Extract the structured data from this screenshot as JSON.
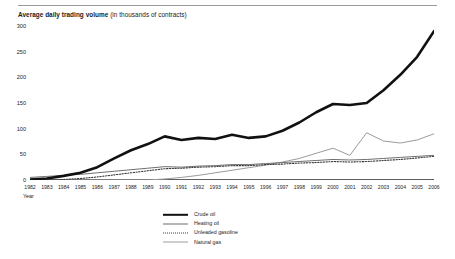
{
  "header": {
    "title_main": "Average daily trading volume",
    "title_sub": " (in thousands of contracts)"
  },
  "axes": {
    "x_label": "Year",
    "y_ticks": [
      "0",
      "50",
      "100",
      "150",
      "200",
      "250",
      "300"
    ],
    "x_ticks": [
      "1982",
      "1983",
      "1984",
      "1985",
      "1986",
      "1987",
      "1988",
      "1989",
      "1990",
      "1991",
      "1992",
      "1993",
      "1994",
      "1995",
      "1996",
      "1997",
      "1998",
      "1999",
      "2000",
      "2001",
      "2002",
      "2003",
      "2004",
      "2005",
      "2006"
    ]
  },
  "legend": {
    "items": [
      {
        "label": "Crude oil",
        "style": "thick-solid",
        "color": "#111111"
      },
      {
        "label": "Heating oil",
        "style": "thin-solid",
        "color": "#6f6f6f"
      },
      {
        "label": "Unleaded gasoline",
        "style": "dotted",
        "color": "#3a3a3a"
      },
      {
        "label": "Natural gas",
        "style": "thin-solid",
        "color": "#9b9b9b"
      }
    ]
  },
  "chart_data": {
    "type": "line",
    "title": "Average daily trading volume (in thousands of contracts)",
    "xlabel": "Year",
    "ylabel": "",
    "ylim": [
      0,
      300
    ],
    "xlim": [
      1982,
      2006
    ],
    "grid": false,
    "legend_position": "bottom-center",
    "x": [
      1982,
      1983,
      1984,
      1985,
      1986,
      1987,
      1988,
      1989,
      1990,
      1991,
      1992,
      1993,
      1994,
      1995,
      1996,
      1997,
      1998,
      1999,
      2000,
      2001,
      2002,
      2003,
      2004,
      2005,
      2006
    ],
    "series": [
      {
        "name": "Crude oil",
        "color": "#111111",
        "style": "thick-solid",
        "values": [
          1,
          3,
          8,
          14,
          25,
          42,
          58,
          70,
          85,
          78,
          82,
          80,
          88,
          82,
          85,
          96,
          112,
          132,
          148,
          146,
          150,
          175,
          205,
          240,
          290
        ]
      },
      {
        "name": "Heating oil",
        "color": "#6f6f6f",
        "style": "thin-solid",
        "values": [
          5,
          7,
          9,
          11,
          14,
          17,
          20,
          23,
          26,
          25,
          27,
          28,
          30,
          30,
          32,
          34,
          36,
          38,
          40,
          39,
          40,
          42,
          44,
          46,
          48
        ]
      },
      {
        "name": "Unleaded gasoline",
        "color": "#3a3a3a",
        "style": "dotted",
        "values": [
          0,
          0,
          1,
          3,
          6,
          10,
          14,
          18,
          22,
          23,
          25,
          26,
          28,
          28,
          30,
          31,
          33,
          34,
          36,
          35,
          36,
          38,
          40,
          43,
          46
        ]
      },
      {
        "name": "Natural gas",
        "color": "#9b9b9b",
        "style": "thin-solid",
        "values": [
          0,
          0,
          0,
          0,
          0,
          0,
          0,
          0,
          2,
          5,
          9,
          14,
          19,
          24,
          29,
          35,
          42,
          52,
          62,
          48,
          92,
          76,
          72,
          78,
          90
        ]
      }
    ]
  }
}
